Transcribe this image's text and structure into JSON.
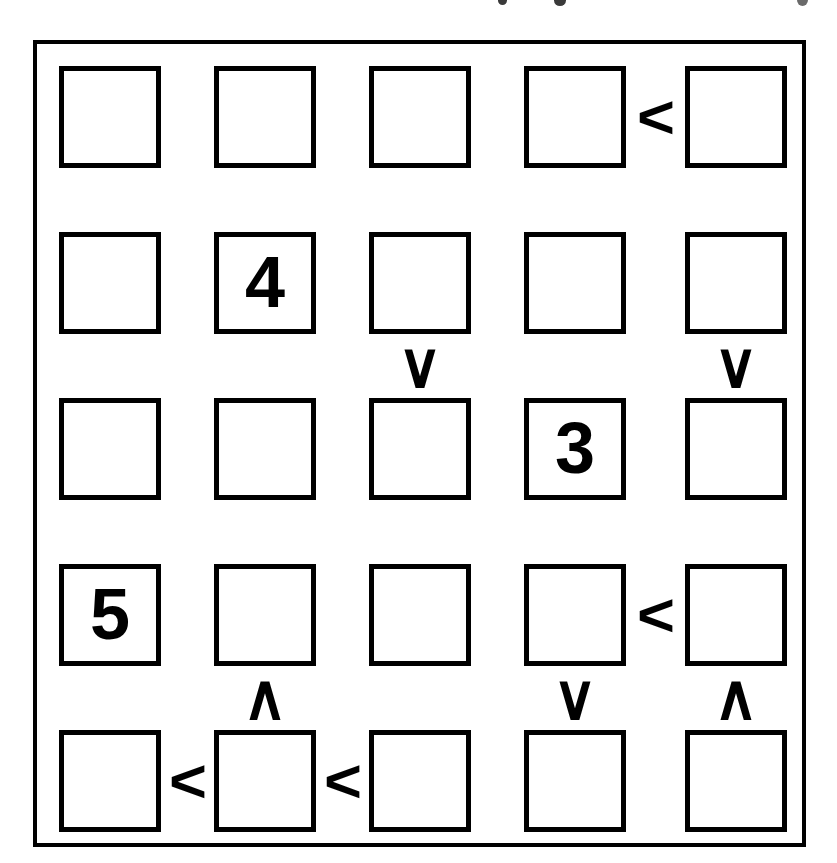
{
  "puzzle": {
    "type": "futoshiki",
    "size": 5,
    "rows": 5,
    "cols": 5,
    "frame_color": "#000000",
    "cell_border_color": "#000000",
    "background_color": "#ffffff",
    "digit_color": "#000000",
    "cells": [
      [
        {
          "row": 1,
          "col": 1,
          "value": ""
        },
        {
          "row": 1,
          "col": 2,
          "value": ""
        },
        {
          "row": 1,
          "col": 3,
          "value": ""
        },
        {
          "row": 1,
          "col": 4,
          "value": ""
        },
        {
          "row": 1,
          "col": 5,
          "value": ""
        }
      ],
      [
        {
          "row": 2,
          "col": 1,
          "value": ""
        },
        {
          "row": 2,
          "col": 2,
          "value": "4"
        },
        {
          "row": 2,
          "col": 3,
          "value": ""
        },
        {
          "row": 2,
          "col": 4,
          "value": ""
        },
        {
          "row": 2,
          "col": 5,
          "value": ""
        }
      ],
      [
        {
          "row": 3,
          "col": 1,
          "value": ""
        },
        {
          "row": 3,
          "col": 2,
          "value": ""
        },
        {
          "row": 3,
          "col": 3,
          "value": ""
        },
        {
          "row": 3,
          "col": 4,
          "value": "3"
        },
        {
          "row": 3,
          "col": 5,
          "value": ""
        }
      ],
      [
        {
          "row": 4,
          "col": 1,
          "value": "5"
        },
        {
          "row": 4,
          "col": 2,
          "value": ""
        },
        {
          "row": 4,
          "col": 3,
          "value": ""
        },
        {
          "row": 4,
          "col": 4,
          "value": ""
        },
        {
          "row": 4,
          "col": 5,
          "value": ""
        }
      ],
      [
        {
          "row": 5,
          "col": 1,
          "value": ""
        },
        {
          "row": 5,
          "col": 2,
          "value": ""
        },
        {
          "row": 5,
          "col": 3,
          "value": ""
        },
        {
          "row": 5,
          "col": 4,
          "value": ""
        },
        {
          "row": 5,
          "col": 5,
          "value": ""
        }
      ]
    ],
    "given_numbers": [
      {
        "row": 2,
        "col": 2,
        "value": "4"
      },
      {
        "row": 3,
        "col": 4,
        "value": "3"
      },
      {
        "row": 4,
        "col": 1,
        "value": "5"
      }
    ],
    "horizontal_constraints": [
      {
        "row": 1,
        "between_cols": [
          4,
          5
        ],
        "symbol": "<",
        "name": "less-than"
      },
      {
        "row": 4,
        "between_cols": [
          4,
          5
        ],
        "symbol": "<",
        "name": "less-than"
      },
      {
        "row": 5,
        "between_cols": [
          1,
          2
        ],
        "symbol": "<",
        "name": "less-than"
      },
      {
        "row": 5,
        "between_cols": [
          2,
          3
        ],
        "symbol": "<",
        "name": "less-than"
      }
    ],
    "vertical_constraints": [
      {
        "col": 3,
        "between_rows": [
          2,
          3
        ],
        "symbol": "∨",
        "name": "greater-than-down"
      },
      {
        "col": 5,
        "between_rows": [
          2,
          3
        ],
        "symbol": "∨",
        "name": "greater-than-down"
      },
      {
        "col": 2,
        "between_rows": [
          4,
          5
        ],
        "symbol": "∧",
        "name": "less-than-up"
      },
      {
        "col": 4,
        "between_rows": [
          4,
          5
        ],
        "symbol": "∨",
        "name": "greater-than-down"
      },
      {
        "col": 5,
        "between_rows": [
          4,
          5
        ],
        "symbol": "∧",
        "name": "less-than-up"
      }
    ],
    "geometry": {
      "cell_size": 102,
      "col_x": [
        22,
        177,
        332,
        487,
        648
      ],
      "row_y": [
        22,
        188,
        354,
        520,
        686
      ]
    }
  }
}
